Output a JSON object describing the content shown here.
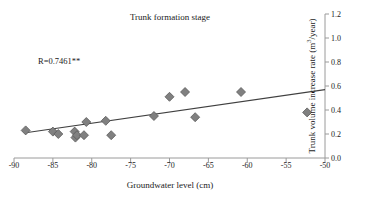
{
  "chart_data": {
    "type": "scatter",
    "title": "Trunk formation stage",
    "xlabel": "Groundwater level (cm)",
    "ylabel": "Trunk volume increase rate (m³/year)",
    "ylabel_base": "Trunk volume increase rate (m",
    "ylabel_sup": "3",
    "ylabel_tail": "/year)",
    "xlim": [
      -90,
      -50
    ],
    "ylim": [
      0.0,
      1.2
    ],
    "xticks": [
      -90,
      -85,
      -80,
      -75,
      -70,
      -65,
      -60,
      -55,
      -50
    ],
    "xtick_labels": [
      "-90",
      "-85",
      "-80",
      "-75",
      "-70",
      "-65",
      "-60",
      "-55",
      "-50"
    ],
    "yticks": [
      0.0,
      0.2,
      0.4,
      0.6,
      0.8,
      1.0,
      1.2
    ],
    "ytick_labels": [
      "0.0",
      "0.2",
      "0.4",
      "0.6",
      "0.8",
      "1.0",
      "1.2"
    ],
    "y_axis_position": "right",
    "grid": false,
    "legend": null,
    "annotations": [
      {
        "name": "correlation",
        "text": "R=0.7461**",
        "x": -85.8,
        "y": 0.78
      }
    ],
    "marker": {
      "shape": "diamond",
      "fill": "#808080",
      "edge": "#5a5a5a",
      "size": 9
    },
    "series": [
      {
        "name": "Trunk volume increase rate",
        "points": [
          {
            "x": -88.5,
            "y": 0.23
          },
          {
            "x": -85.0,
            "y": 0.22
          },
          {
            "x": -84.3,
            "y": 0.2
          },
          {
            "x": -82.2,
            "y": 0.22
          },
          {
            "x": -82.1,
            "y": 0.17
          },
          {
            "x": -81.9,
            "y": 0.19
          },
          {
            "x": -81.0,
            "y": 0.19
          },
          {
            "x": -80.7,
            "y": 0.3
          },
          {
            "x": -78.2,
            "y": 0.31
          },
          {
            "x": -77.5,
            "y": 0.19
          },
          {
            "x": -72.0,
            "y": 0.35
          },
          {
            "x": -70.0,
            "y": 0.51
          },
          {
            "x": -68.0,
            "y": 0.55
          },
          {
            "x": -66.7,
            "y": 0.34
          },
          {
            "x": -60.8,
            "y": 0.55
          },
          {
            "x": -52.3,
            "y": 0.38
          }
        ]
      }
    ],
    "trendline": {
      "name": "linear-fit",
      "x_start": -88.5,
      "y_start": 0.21,
      "x_end": -50.0,
      "y_end": 0.57,
      "color": "#404040"
    },
    "axis_color": "#9a9a9a"
  }
}
